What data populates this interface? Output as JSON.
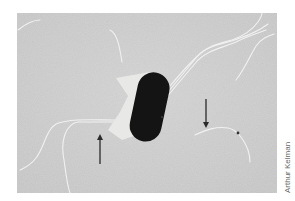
{
  "figure": {
    "credit": "Arthur Kelman",
    "colors": {
      "background": "#c9c9c9",
      "cell_body": "#141414",
      "shadow": "#e9e9e7",
      "flagella": "#f2f2f2",
      "arrows": "#2a2a2a"
    },
    "arrows": [
      {
        "id": "left",
        "direction": "up",
        "x": 100,
        "y1": 134,
        "y2": 164
      },
      {
        "id": "right",
        "direction": "down",
        "x": 206,
        "y1": 99,
        "y2": 128
      }
    ]
  }
}
